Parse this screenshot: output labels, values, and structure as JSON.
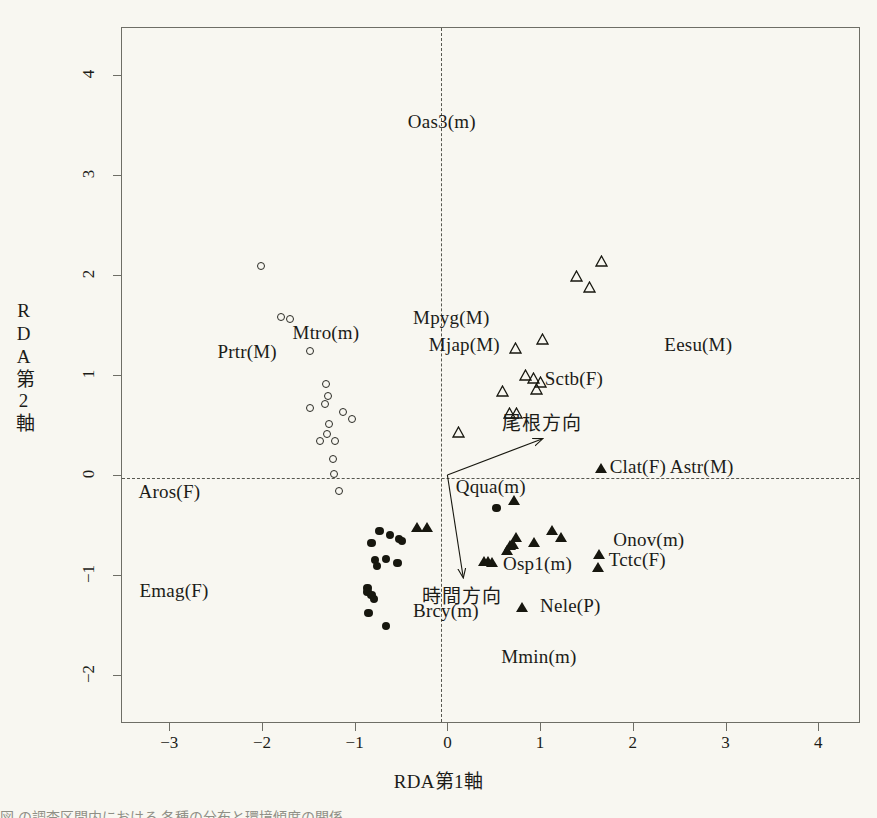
{
  "chart_data": {
    "type": "scatter",
    "title": "",
    "xlabel": "RDA第1軸",
    "ylabel": "RDA第2軸",
    "xlim": [
      -3.52,
      4.45
    ],
    "ylim": [
      -2.48,
      4.48
    ],
    "xticks": [
      "-3",
      "-2",
      "-1",
      "0",
      "1",
      "2",
      "3",
      "4"
    ],
    "xtick_values": [
      -3,
      -2,
      -1,
      0,
      1,
      2,
      3,
      4
    ],
    "yticks": [
      "-2",
      "-1",
      "0",
      "1",
      "2",
      "3",
      "4"
    ],
    "ytick_values": [
      -2,
      -1,
      0,
      1,
      2,
      3,
      4
    ],
    "grid": false,
    "legend": "none",
    "reference_lines": [
      {
        "name": "vertical-zero-line",
        "axis": "x",
        "value": 0,
        "style": "dashed"
      },
      {
        "name": "horizontal-zero-line",
        "axis": "y",
        "value": 0,
        "style": "dashed"
      }
    ],
    "series": [
      {
        "name": "open-circles",
        "marker": "open-circle",
        "points": [
          [
            -2.0,
            2.08
          ],
          [
            -1.78,
            1.57
          ],
          [
            -1.69,
            1.55
          ],
          [
            -1.47,
            1.23
          ],
          [
            -1.3,
            0.9
          ],
          [
            -1.28,
            0.78
          ],
          [
            -1.31,
            0.7
          ],
          [
            -1.12,
            0.62
          ],
          [
            -1.47,
            0.66
          ],
          [
            -1.02,
            0.55
          ],
          [
            -1.27,
            0.5
          ],
          [
            -1.29,
            0.4
          ],
          [
            -1.36,
            0.33
          ],
          [
            -1.2,
            0.33
          ],
          [
            -1.22,
            0.15
          ],
          [
            -1.21,
            0.0
          ],
          [
            -1.16,
            -0.17
          ]
        ]
      },
      {
        "name": "open-triangles",
        "marker": "open-triangle",
        "points": [
          [
            1.66,
            2.14
          ],
          [
            1.39,
            1.99
          ],
          [
            1.53,
            1.88
          ],
          [
            1.03,
            1.36
          ],
          [
            0.74,
            1.27
          ],
          [
            0.84,
            1.0
          ],
          [
            0.93,
            0.97
          ],
          [
            1.0,
            0.93
          ],
          [
            0.96,
            0.86
          ],
          [
            0.59,
            0.84
          ],
          [
            0.67,
            0.62
          ],
          [
            0.75,
            0.62
          ],
          [
            0.12,
            0.43
          ]
        ]
      },
      {
        "name": "filled-circles",
        "marker": "filled-circle",
        "points": [
          [
            -0.73,
            -0.56
          ],
          [
            -0.62,
            -0.6
          ],
          [
            -0.52,
            -0.64
          ],
          [
            -0.82,
            -0.68
          ],
          [
            -0.49,
            -0.66
          ],
          [
            -0.78,
            -0.85
          ],
          [
            -0.66,
            -0.84
          ],
          [
            -0.76,
            -0.91
          ],
          [
            -0.54,
            -0.88
          ],
          [
            -0.86,
            -1.13
          ],
          [
            -0.86,
            -1.17
          ],
          [
            -0.82,
            -1.2
          ],
          [
            -0.79,
            -1.24
          ],
          [
            -0.85,
            -1.38
          ],
          [
            -0.66,
            -1.51
          ],
          [
            0.53,
            -0.33
          ]
        ]
      },
      {
        "name": "filled-triangles",
        "marker": "filled-triangle",
        "points": [
          [
            1.66,
            0.07
          ],
          [
            0.72,
            -0.25
          ],
          [
            -0.33,
            -0.52
          ],
          [
            -0.22,
            -0.52
          ],
          [
            1.13,
            -0.55
          ],
          [
            1.22,
            -0.62
          ],
          [
            0.74,
            -0.62
          ],
          [
            0.68,
            -0.7
          ],
          [
            0.71,
            -0.69
          ],
          [
            0.93,
            -0.67
          ],
          [
            0.64,
            -0.75
          ],
          [
            1.63,
            -0.79
          ],
          [
            0.4,
            -0.86
          ],
          [
            0.44,
            -0.86
          ],
          [
            0.48,
            -0.87
          ],
          [
            1.62,
            -0.92
          ],
          [
            0.8,
            -1.32
          ]
        ]
      }
    ],
    "point_labels": [
      {
        "text": "Oas3(m)",
        "x": -0.06,
        "y": 3.52,
        "align": "center"
      },
      {
        "text": "Prtr(M)",
        "x": -2.48,
        "y": 1.22,
        "align": "left"
      },
      {
        "text": "Mtro(m)",
        "x": -1.67,
        "y": 1.41,
        "align": "left"
      },
      {
        "text": "Mpyg(M)",
        "x": -0.37,
        "y": 1.56,
        "align": "left"
      },
      {
        "text": "Mjap(M)",
        "x": -0.2,
        "y": 1.29,
        "align": "left"
      },
      {
        "text": "Sctb(F)",
        "x": 1.05,
        "y": 0.95,
        "align": "left"
      },
      {
        "text": "Eesu(M)",
        "x": 2.34,
        "y": 1.29,
        "align": "left"
      },
      {
        "text": "Aros(F)",
        "x": -3.33,
        "y": -0.18,
        "align": "left"
      },
      {
        "text": "Emag(F)",
        "x": -3.32,
        "y": -1.17,
        "align": "left"
      },
      {
        "text": "Clat(F) Astr(M)",
        "x": 1.75,
        "y": 0.07,
        "align": "left"
      },
      {
        "text": "Qqua(m)",
        "x": 0.09,
        "y": -0.13,
        "align": "left"
      },
      {
        "text": "Onov(m)",
        "x": 1.79,
        "y": -0.66,
        "align": "left"
      },
      {
        "text": "Tctc(F)",
        "x": 1.74,
        "y": -0.86,
        "align": "left"
      },
      {
        "text": "Osp1(m)",
        "x": 0.6,
        "y": -0.9,
        "align": "left"
      },
      {
        "text": "Brcy(m)",
        "x": -0.37,
        "y": -1.37,
        "align": "left"
      },
      {
        "text": "Nele(P)",
        "x": 1.0,
        "y": -1.32,
        "align": "left"
      },
      {
        "text": "Mmin(m)",
        "x": 0.58,
        "y": -1.83,
        "align": "left"
      }
    ],
    "vectors": [
      {
        "name": "ridge-direction",
        "label": "尾根方向",
        "from": [
          0,
          0
        ],
        "to": [
          1.02,
          0.36
        ],
        "label_x": 1.02,
        "label_y": 0.54
      },
      {
        "name": "time-direction",
        "label": "時間方向",
        "from": [
          0,
          0
        ],
        "to": [
          0.17,
          -1.02
        ],
        "label_x": 0.16,
        "label_y": -1.19
      }
    ]
  },
  "caption": {
    "fragment": "図   の調査区間内における   各種の分布と環境傾度の関係"
  },
  "colors": {
    "background": "#f8f7f1",
    "frame": "#6e6e66",
    "marker": "#17170f",
    "dashed_line": "#57574f",
    "text": "#1c1c18"
  }
}
